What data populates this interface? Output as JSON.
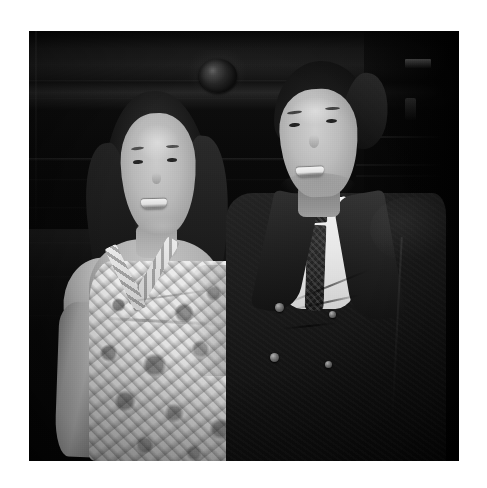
{
  "page": {
    "background_color": "#ffffff",
    "width": 487,
    "height": 488
  },
  "photograph": {
    "name": "couple-portrait-photo",
    "medium": "black-and-white photograph",
    "alt_text": "Black and white photograph of a smiling woman in a floral halter dress standing beside a smiling man in a dark double-breasted suit with a white shirt and dark tie, in front of dark wood panelling.",
    "frame": {
      "left": 29,
      "top": 31,
      "width": 430,
      "height": 430,
      "border_color": "#ffffff"
    },
    "tone": {
      "darkest": "#090909",
      "shadow": "#1a1816",
      "midtone": "#9a8269",
      "highlight": "#f4f2ee",
      "paper_white": "#ffffff"
    },
    "subjects": [
      {
        "id": "woman",
        "label": "Woman on the left",
        "hair": "long dark hair parted, falling past the shoulders",
        "expression": "broad smile, teeth showing",
        "garment": "sleeveless floral-print halter dress with crossed straps at the neckline",
        "garment_colors": [
          "#f1ece4",
          "#3a3a3a"
        ],
        "skin_tone": "#c5ae98",
        "position": "left of frame, slightly lower than the man"
      },
      {
        "id": "man",
        "label": "Man on the right",
        "hair": "short dark hair swept back",
        "expression": "smiling, teeth showing",
        "garment": "dark double-breasted suit jacket over white dress shirt with dark patterned tie",
        "garment_colors": [
          "#1e1c1a",
          "#f4f2ee",
          "#2b2722"
        ],
        "suit_buttons_visible": 4,
        "skin_tone": "#cdb7a0",
        "position": "right of frame, taller, standing slightly behind"
      }
    ],
    "background": {
      "description": "dark wood-panelled interior wall with horizontal mouldings, a round medallion or knob at upper left-of-centre, and a dark recessed area with a faint lit shelf at the far right",
      "elements": [
        {
          "name": "wood-panel-mouldings",
          "count": 8
        },
        {
          "name": "round-medallion",
          "position": "upper centre-left"
        },
        {
          "name": "right-recess",
          "position": "far right edge"
        },
        {
          "name": "shelf-highlight",
          "position": "upper right"
        }
      ]
    }
  }
}
